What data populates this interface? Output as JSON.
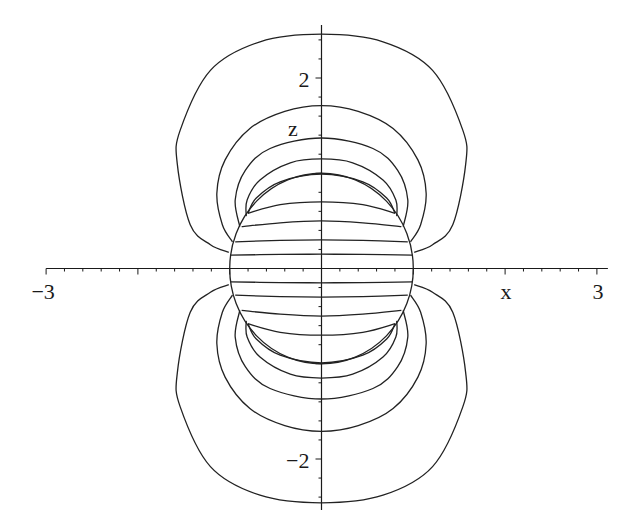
{
  "chart_data": {
    "type": "line",
    "title": "",
    "xlabel": "x",
    "ylabel": "z",
    "xlim": [
      -3,
      3
    ],
    "ylim": [
      -2.55,
      2.55
    ],
    "grid": false,
    "legend": "none",
    "x_ticks": {
      "major": [
        {
          "value": -3,
          "label": "−3"
        },
        {
          "value": 3,
          "label": "3"
        }
      ],
      "minor_step": 0.2
    },
    "y_ticks": {
      "major": [
        {
          "value": 2,
          "label": "2"
        },
        {
          "value": -2,
          "label": "−2"
        }
      ],
      "minor_step": 0.2
    },
    "symmetry": "mirrored in x and z",
    "sphere": {
      "center": [
        0,
        0
      ],
      "radius": 1
    },
    "series": [
      {
        "name": "outer-contour",
        "points": [
          [
            -1.01,
            0.17
          ],
          [
            -1.21,
            0.25
          ],
          [
            -1.43,
            0.46
          ],
          [
            -1.57,
            1.09
          ],
          [
            -1.54,
            1.45
          ],
          [
            -1.21,
            2.08
          ],
          [
            -0.67,
            2.38
          ],
          [
            0,
            2.46
          ]
        ]
      },
      {
        "name": "contour-2",
        "points": [
          [
            -0.97,
            0.28
          ],
          [
            -1.08,
            0.46
          ],
          [
            -1.14,
            0.79
          ],
          [
            -1.05,
            1.14
          ],
          [
            -0.78,
            1.47
          ],
          [
            -0.4,
            1.65
          ],
          [
            0,
            1.71
          ]
        ]
      },
      {
        "name": "contour-3",
        "points": [
          [
            -0.89,
            0.44
          ],
          [
            -0.94,
            0.72
          ],
          [
            -0.83,
            1.03
          ],
          [
            -0.56,
            1.26
          ],
          [
            0,
            1.37
          ]
        ]
      },
      {
        "name": "contour-4",
        "points": [
          [
            -0.82,
            0.55
          ],
          [
            -0.81,
            0.72
          ],
          [
            -0.67,
            0.93
          ],
          [
            -0.34,
            1.11
          ],
          [
            0,
            1.15
          ]
        ]
      },
      {
        "name": "contour-5",
        "points": [
          [
            -0.8,
            0.58
          ],
          [
            -0.71,
            0.74
          ],
          [
            -0.45,
            0.91
          ],
          [
            0,
            0.99
          ]
        ]
      },
      {
        "name": "interior-0.70",
        "points": [
          [
            -0.8,
            0.58
          ],
          [
            -0.45,
            0.67
          ],
          [
            0,
            0.7
          ]
        ]
      },
      {
        "name": "interior-0.50",
        "points": [
          [
            -0.87,
            0.44
          ],
          [
            -0.45,
            0.48
          ],
          [
            0,
            0.5
          ]
        ]
      },
      {
        "name": "interior-0.30",
        "points": [
          [
            -0.94,
            0.28
          ],
          [
            -0.45,
            0.295
          ],
          [
            0,
            0.3
          ]
        ]
      },
      {
        "name": "interior-0.15",
        "points": [
          [
            -0.99,
            0.14
          ],
          [
            -0.45,
            0.148
          ],
          [
            0,
            0.15
          ]
        ]
      }
    ]
  }
}
